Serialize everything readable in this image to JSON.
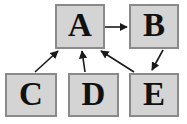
{
  "diagram": {
    "background_color": "#ffffff",
    "node_fill_color": "#d4d4d4",
    "node_border_color": "#8a8a8a",
    "edge_color": "#1a1a1a",
    "label_color": "#111111",
    "nodes": [
      {
        "id": "A",
        "label": "A",
        "x": 55,
        "y": 4,
        "width": 50,
        "height": 45
      },
      {
        "id": "B",
        "label": "B",
        "x": 129,
        "y": 4,
        "width": 50,
        "height": 45
      },
      {
        "id": "C",
        "label": "C",
        "x": 5,
        "y": 73,
        "width": 52,
        "height": 44
      },
      {
        "id": "D",
        "label": "D",
        "x": 68,
        "y": 73,
        "width": 51,
        "height": 44
      },
      {
        "id": "E",
        "label": "E",
        "x": 129,
        "y": 73,
        "width": 50,
        "height": 44
      }
    ],
    "edges": [
      {
        "id": "a-to-b",
        "from": "A",
        "to": "B",
        "direction": "right",
        "arrowhead": "at-b"
      },
      {
        "id": "b-to-e",
        "from": "B",
        "to": "E",
        "direction": "down-left",
        "arrowhead": "at-e"
      },
      {
        "id": "c-to-a",
        "from": "C",
        "to": "A",
        "direction": "up-right",
        "arrowhead": "at-a"
      },
      {
        "id": "d-to-a",
        "from": "D",
        "to": "A",
        "direction": "up",
        "arrowhead": "at-a"
      },
      {
        "id": "e-to-a",
        "from": "E",
        "to": "A",
        "direction": "up-left",
        "arrowhead": "at-a"
      }
    ]
  }
}
